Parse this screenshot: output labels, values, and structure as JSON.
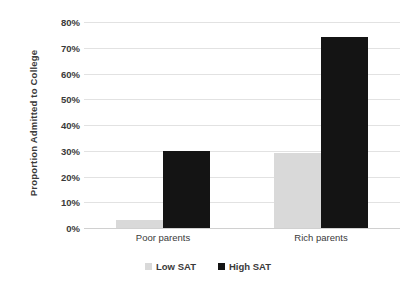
{
  "chart_data": {
    "type": "bar",
    "title": "",
    "xlabel": "",
    "ylabel": "Proportion Admitted to College",
    "categories": [
      "Poor parents",
      "Rich parents"
    ],
    "series": [
      {
        "name": "Low SAT",
        "color": "#d9d9d9",
        "values": [
          0.03,
          0.29
        ]
      },
      {
        "name": "High SAT",
        "color": "#141414",
        "values": [
          0.3,
          0.74
        ]
      }
    ],
    "ylim": [
      0,
      0.8
    ],
    "y_ticks": [
      "0%",
      "10%",
      "20%",
      "30%",
      "40%",
      "50%",
      "60%",
      "70%",
      "80%"
    ],
    "y_tick_values": [
      0,
      0.1,
      0.2,
      0.3,
      0.4,
      0.5,
      0.6,
      0.7,
      0.8
    ],
    "grid": true,
    "grid_color": "#e2e2e2",
    "legend_position": "bottom",
    "background": "#ffffff",
    "text_color": "#3a3a3a"
  }
}
